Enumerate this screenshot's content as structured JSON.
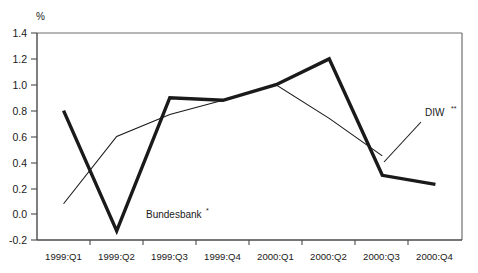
{
  "chart_data": {
    "type": "line",
    "title": "",
    "xlabel": "",
    "ylabel": "%",
    "ylim": [
      -0.2,
      1.4
    ],
    "ytick_labels": [
      "1.4",
      "1.2",
      "1.0",
      "0.8",
      "0.6",
      "0.4",
      "0.2",
      "0.0",
      "-0.2"
    ],
    "ytick_values": [
      1.4,
      1.2,
      1.0,
      0.8,
      0.6,
      0.4,
      0.2,
      0.0,
      -0.2
    ],
    "grid": false,
    "legend_position": "inline-annotation",
    "categories": [
      "1999:Q1",
      "1999:Q2",
      "1999:Q3",
      "1999:Q4",
      "2000:Q1",
      "2000:Q2",
      "2000:Q3",
      "2000:Q4"
    ],
    "series": [
      {
        "name": "Bundesbank",
        "label": "Bundesbank",
        "label_superscript": "*",
        "style": "thick-solid",
        "color": "#1a1a1a",
        "values": [
          0.8,
          -0.13,
          0.9,
          0.88,
          1.0,
          1.2,
          0.3,
          0.23
        ]
      },
      {
        "name": "DIW",
        "label": "DIW",
        "label_superscript": "**",
        "style": "thin-solid",
        "color": "#1a1a1a",
        "values": [
          0.08,
          0.6,
          0.77,
          0.88,
          1.0,
          0.74,
          0.45,
          null
        ]
      }
    ],
    "annotations": [
      {
        "text": "Bundesbank",
        "superscript": "*",
        "x": 146,
        "y": 218
      },
      {
        "text": "DIW",
        "superscript": "**",
        "x": 425,
        "y": 116
      }
    ]
  },
  "axis": {
    "unit_label": "%"
  }
}
